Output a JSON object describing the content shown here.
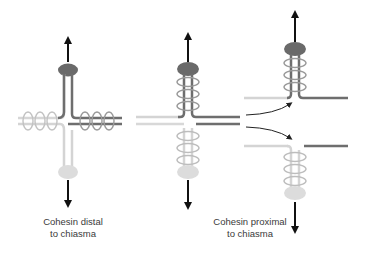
{
  "panels": [
    {
      "id": "distal",
      "caption_line1": "Cohesin distal",
      "caption_line2": "to chiasma",
      "cohesin_position": "distal"
    },
    {
      "id": "proximal",
      "caption_line1": "Cohesin proximal",
      "caption_line2": "to chiasma",
      "cohesin_position": "proximal"
    }
  ],
  "colors": {
    "dark_chromatid": "#6e6e6e",
    "light_chromatid": "#d0d0d0",
    "dark_centromere": "#6a6a6a",
    "light_centromere": "#dcdcdc",
    "cohesin_ring_dark": "#9a9a9a",
    "cohesin_ring_light": "#bdbdbd",
    "arrow": "#111111"
  }
}
